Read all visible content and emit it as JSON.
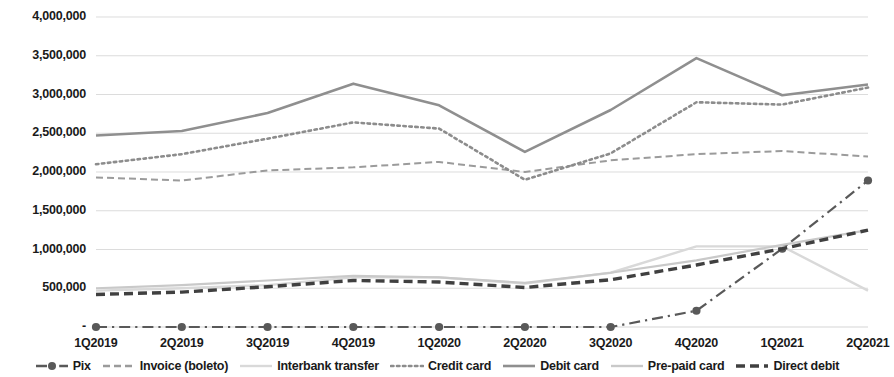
{
  "chart_data": {
    "type": "line",
    "title": "",
    "subtitle": "",
    "xlabel": "",
    "ylabel": "",
    "grid": true,
    "legend_position": "bottom",
    "ylim": [
      0,
      4000000
    ],
    "ytick_labels": [
      "-",
      "500,000",
      "1,000,000",
      "1,500,000",
      "2,000,000",
      "2,500,000",
      "3,000,000",
      "3,500,000",
      "4,000,000"
    ],
    "ytick_values": [
      0,
      500000,
      1000000,
      1500000,
      2000000,
      2500000,
      3000000,
      3500000,
      4000000
    ],
    "categories": [
      "1Q2019",
      "2Q2019",
      "3Q2019",
      "4Q2019",
      "1Q2020",
      "2Q2020",
      "3Q2020",
      "4Q2020",
      "1Q2021",
      "2Q2021"
    ],
    "series": [
      {
        "name": "Pix",
        "style": "dash-dot",
        "marker": "circle",
        "color": "#595959",
        "width": 2.2,
        "values": [
          0,
          0,
          0,
          0,
          0,
          0,
          0,
          210000,
          1010000,
          1890000
        ]
      },
      {
        "name": "Invoice (boleto)",
        "style": "dashed",
        "marker": "none",
        "color": "#9b9b9b",
        "width": 2.0,
        "values": [
          1930000,
          1890000,
          2020000,
          2060000,
          2130000,
          2000000,
          2150000,
          2230000,
          2270000,
          2200000
        ]
      },
      {
        "name": "Interbank transfer",
        "style": "solid",
        "marker": "none",
        "color": "#d9d9d9",
        "width": 2.4,
        "values": [
          470000,
          500000,
          540000,
          640000,
          640000,
          560000,
          700000,
          1040000,
          1040000,
          470000
        ]
      },
      {
        "name": "Credit card",
        "style": "dotted",
        "marker": "none",
        "color": "#8c8c8c",
        "width": 2.6,
        "values": [
          2100000,
          2230000,
          2430000,
          2640000,
          2560000,
          1900000,
          2240000,
          2900000,
          2870000,
          3090000
        ]
      },
      {
        "name": "Debit card",
        "style": "solid",
        "marker": "none",
        "color": "#8f8f8f",
        "width": 2.6,
        "values": [
          2470000,
          2530000,
          2760000,
          3140000,
          2860000,
          2260000,
          2800000,
          3470000,
          2990000,
          3130000
        ]
      },
      {
        "name": "Pre-paid card",
        "style": "solid",
        "marker": "none",
        "color": "#c9c9c9",
        "width": 2.2,
        "values": [
          500000,
          540000,
          600000,
          660000,
          640000,
          570000,
          700000,
          860000,
          1060000,
          1250000
        ]
      },
      {
        "name": "Direct debit",
        "style": "dashed",
        "marker": "none",
        "color": "#404040",
        "width": 3.4,
        "values": [
          420000,
          450000,
          520000,
          600000,
          580000,
          510000,
          610000,
          800000,
          1010000,
          1250000
        ]
      }
    ]
  },
  "axis": {
    "y_ticks": [
      "4,000,000",
      "3,500,000",
      "3,000,000",
      "2,500,000",
      "2,000,000",
      "1,500,000",
      "1,000,000",
      "500,000",
      "-"
    ],
    "x_ticks": [
      "1Q2019",
      "2Q2019",
      "3Q2019",
      "4Q2019",
      "1Q2020",
      "2Q2020",
      "3Q2020",
      "4Q2020",
      "1Q2021",
      "2Q2021"
    ]
  },
  "legend": {
    "items": [
      {
        "label": "Pix"
      },
      {
        "label": "Invoice (boleto)"
      },
      {
        "label": "Interbank transfer"
      },
      {
        "label": "Credit card"
      },
      {
        "label": "Debit card"
      },
      {
        "label": "Pre-paid card"
      },
      {
        "label": "Direct debit"
      }
    ]
  },
  "colors": {
    "grid": "#d6d6d6",
    "text": "#1a1a1a",
    "background": "#ffffff"
  }
}
